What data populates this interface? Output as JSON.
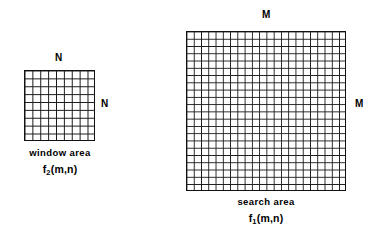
{
  "figure": {
    "background_color": "#ffffff",
    "line_color": "#1a1a1a",
    "border_color": "#111111"
  },
  "window_area": {
    "top_dimension_label": "N",
    "right_dimension_label": "N",
    "caption": "window area",
    "function_base": "f",
    "function_subscript": "2",
    "function_args": "(m,n)",
    "grid_columns": 9,
    "grid_rows": 9
  },
  "search_area": {
    "top_dimension_label": "M",
    "right_dimension_label": "M",
    "caption": "search area",
    "function_base": "f",
    "function_subscript": "1",
    "function_args": "(m,n)",
    "grid_columns": 22,
    "grid_rows": 22
  }
}
